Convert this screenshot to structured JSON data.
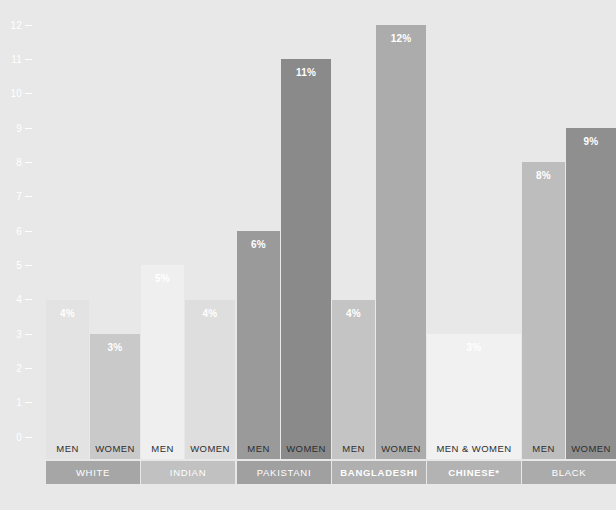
{
  "chart_data": {
    "type": "bar",
    "title": "",
    "subtitle": "",
    "xlabel": "",
    "ylabel": "",
    "ylim": [
      0,
      12
    ],
    "ytick_labels": [
      "0",
      "1",
      "2",
      "3",
      "4",
      "5",
      "6",
      "7",
      "8",
      "9",
      "10",
      "11",
      "12"
    ],
    "ytick_values": [
      0,
      1,
      2,
      3,
      4,
      5,
      6,
      7,
      8,
      9,
      10,
      11,
      12
    ],
    "grid": false,
    "legend": "none",
    "value_label_suffix": "%",
    "categories": [
      "White Men",
      "White Women",
      "Indian Men",
      "Indian Women",
      "Pakistani Men",
      "Pakistani Women",
      "Bangladeshi Men",
      "Bangladeshi Women",
      "Chinese Men & Women",
      "Black Men",
      "Black Women"
    ],
    "values": [
      4,
      3,
      5,
      4,
      6,
      11,
      4,
      12,
      3,
      8,
      9
    ],
    "value_labels": [
      "4%",
      "3%",
      "5%",
      "4%",
      "6%",
      "11%",
      "4%",
      "12%",
      "3%",
      "8%",
      "9%"
    ],
    "bars": [
      {
        "group": "WHITE",
        "sub": "MEN",
        "value": 4,
        "label": "4%",
        "color": "#e3e3e3",
        "x": 18,
        "w": 54
      },
      {
        "group": "WHITE",
        "sub": "WOMEN",
        "value": 3,
        "label": "3%",
        "color": "#c9c9c9",
        "x": 74,
        "w": 63
      },
      {
        "group": "INDIAN",
        "sub": "MEN",
        "value": 5,
        "label": "5%",
        "color": "#efefef",
        "x": 139,
        "w": 54
      },
      {
        "group": "INDIAN",
        "sub": "WOMEN",
        "value": 4,
        "label": "4%",
        "color": "#dedede",
        "x": 195,
        "w": 63
      },
      {
        "group": "PAKISTANI",
        "sub": "MEN",
        "value": 6,
        "label": "6%",
        "color": "#9a9a9a",
        "x": 260,
        "w": 54
      },
      {
        "group": "PAKISTANI",
        "sub": "WOMEN",
        "value": 11,
        "label": "11%",
        "color": "#8a8a8a",
        "x": 316,
        "w": 63
      },
      {
        "group": "BANGLADESHI",
        "sub": "MEN",
        "value": 4,
        "label": "4%",
        "color": "#c4c4c4",
        "x": 381,
        "w": 54
      },
      {
        "group": "BANGLADESHI",
        "sub": "WOMEN",
        "value": 12,
        "label": "12%",
        "color": "#acacac",
        "x": 437,
        "w": 63
      },
      {
        "group": "CHINESE*",
        "sub": "MEN & WOMEN",
        "value": 3,
        "label": "3%",
        "color": "#f1f1f1",
        "x": 502,
        "w": 119
      },
      {
        "group": "BLACK",
        "sub": "MEN",
        "value": 8,
        "label": "8%",
        "color": "#bdbdbd",
        "x": 623,
        "w": 54
      },
      {
        "group": "BLACK",
        "sub": "WOMEN",
        "value": 9,
        "label": "9%",
        "color": "#8f8f8f",
        "x": 679,
        "w": 63
      }
    ],
    "groups": [
      {
        "label": "WHITE",
        "bold": false,
        "color": "#a6a6a6",
        "x": 18,
        "w": 119
      },
      {
        "label": "INDIAN",
        "bold": false,
        "color": "#c1c1c1",
        "x": 139,
        "w": 119
      },
      {
        "label": "PAKISTANI",
        "bold": false,
        "color": "#a0a0a0",
        "x": 260,
        "w": 119
      },
      {
        "label": "BANGLADESHI",
        "bold": true,
        "color": "#b0b0b0",
        "x": 381,
        "w": 119
      },
      {
        "label": "CHINESE*",
        "bold": true,
        "color": "#b3b3b3",
        "x": 502,
        "w": 119
      },
      {
        "label": "BLACK",
        "bold": false,
        "color": "#ababab",
        "x": 623,
        "w": 119
      }
    ],
    "colors": {
      "background": "#e8e8e8",
      "axis_text": "#ffffff",
      "value_text": "#ffffff",
      "sub_label_text": "#2e2e2e",
      "group_label_text": "#ffffff"
    }
  }
}
